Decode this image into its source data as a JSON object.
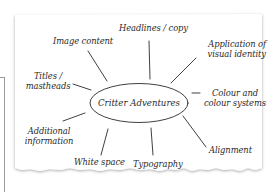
{
  "diagram": {
    "center": "Critter Adventures",
    "nodes": {
      "image_content": "Image content",
      "headlines": "Headlines / copy",
      "application_l1": "Application of",
      "application_l2": "visual identity",
      "titles_l1": "Titles /",
      "titles_l2": "mastheads",
      "colour_l1": "Colour and",
      "colour_l2": "colour systems",
      "additional_l1": "Additional",
      "additional_l2": "information",
      "white_space": "White space",
      "typography": "Typography",
      "alignment": "Alignment"
    },
    "colors": {
      "ink": "#2a2a2a",
      "paper": "#ffffff",
      "shadow": "#d6d6d6",
      "frame": "#9a9a9a"
    }
  }
}
